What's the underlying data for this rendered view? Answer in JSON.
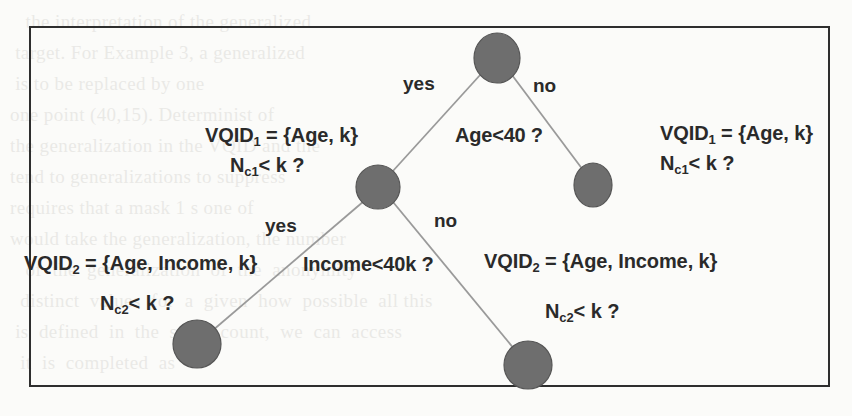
{
  "figure": {
    "type": "decision-tree-diagram",
    "border_color": "#2e2e2e",
    "node_fill": "#6e6e6e",
    "node_stroke": "#4a4a4a",
    "edge_color": "#9a9a9a",
    "background": "#fbfbf9"
  },
  "nodes": [
    {
      "id": "root",
      "cx": 497,
      "cy": 58,
      "r": 22
    },
    {
      "id": "left-child",
      "cx": 378,
      "cy": 187,
      "r": 21
    },
    {
      "id": "right-child",
      "cx": 593,
      "cy": 185,
      "r": 19
    },
    {
      "id": "leaf-left",
      "cx": 197,
      "cy": 344,
      "r": 23
    },
    {
      "id": "leaf-right",
      "cx": 528,
      "cy": 365,
      "r": 23
    }
  ],
  "edges": [
    {
      "from": "root",
      "to": "left-child",
      "branch": "yes"
    },
    {
      "from": "root",
      "to": "right-child",
      "branch": "no"
    },
    {
      "from": "left-child",
      "to": "leaf-left",
      "branch": "yes"
    },
    {
      "from": "left-child",
      "to": "leaf-right",
      "branch": "no"
    }
  ],
  "labels": {
    "root_condition": "Age<40 ?",
    "root_yes": "yes",
    "root_no": "no",
    "level2_condition": "Income<40k ?",
    "level2_yes": "yes",
    "level2_no": "no",
    "vqid1_left_prefix": "VQID",
    "vqid1_left_sub": "1",
    "vqid1_left_body": " = {Age, k}",
    "nc1_left_prefix": "N",
    "nc1_left_sub": "c1",
    "nc1_left_body": "< k ?",
    "vqid1_right_prefix": "VQID",
    "vqid1_right_sub": "1",
    "vqid1_right_body": " = {Age, k}",
    "nc1_right_prefix": "N",
    "nc1_right_sub": "c1",
    "nc1_right_body": "< k ?",
    "vqid2_left_prefix": "VQID",
    "vqid2_left_sub": "2",
    "vqid2_left_body": " = {Age, Income, k}",
    "nc2_left_prefix": "N",
    "nc2_left_sub": "c2",
    "nc2_left_body": "< k ?",
    "vqid2_right_prefix": "VQID",
    "vqid2_right_sub": "2",
    "vqid2_right_body": " = {Age, Income, k}",
    "nc2_right_prefix": "N",
    "nc2_right_sub": "c2",
    "nc2_right_body": "< k ?"
  },
  "background_text": {
    "lines": [
      "   the interpretation of the generalized",
      " target. For Example 3, a generalized",
      " is to be replaced by one",
      "one point (40,15). Determinist of",
      "the generalization in the VQID and the",
      "tend to generalizations to suppress",
      "requires that a mask 1 s one of",
      "would take the generalization, the number",
      "   of  the  generalization  of  the  anonymity",
      "  distinct  values  for  a  given  how  possible  all this",
      " is  defined  in  the  same  count,  we  can  access",
      "  it  is  completed  as"
    ]
  }
}
